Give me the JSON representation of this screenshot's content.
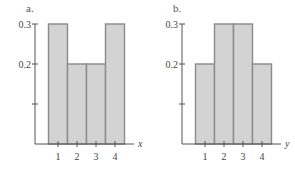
{
  "colors": {
    "bar_fill": "#d3d3d3",
    "bar_stroke": "#8a8a8a",
    "axis": "#555555"
  },
  "chart_data": [
    {
      "type": "bar",
      "panel_label": "a.",
      "categories": [
        "1",
        "2",
        "3",
        "4"
      ],
      "values": [
        0.3,
        0.2,
        0.2,
        0.3
      ],
      "xlabel": "x",
      "ylabel": "",
      "ylim": [
        0,
        0.3
      ],
      "yticks": [
        0.1,
        0.2,
        0.3
      ],
      "ytick_labels": [
        "",
        "0.2",
        "0.3"
      ],
      "grid": false
    },
    {
      "type": "bar",
      "panel_label": "b.",
      "categories": [
        "1",
        "2",
        "3",
        "4"
      ],
      "values": [
        0.2,
        0.3,
        0.3,
        0.2
      ],
      "xlabel": "y",
      "ylabel": "",
      "ylim": [
        0,
        0.3
      ],
      "yticks": [
        0.1,
        0.2,
        0.3
      ],
      "ytick_labels": [
        "",
        "0.2",
        "0.3"
      ],
      "grid": false
    }
  ]
}
